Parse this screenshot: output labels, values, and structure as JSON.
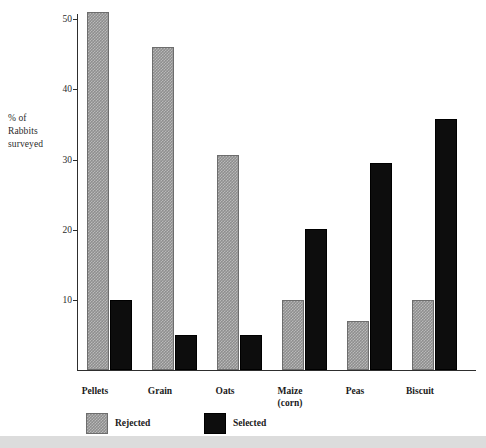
{
  "chart_data": {
    "type": "bar",
    "title": "",
    "subtitle": "",
    "xlabel": "",
    "ylabel": "% of Rabbits surveyed",
    "ylim": [
      0,
      52
    ],
    "yticks": [
      10,
      20,
      30,
      40,
      50
    ],
    "grid": false,
    "legend_position": "bottom-left",
    "categories": [
      "Pellets",
      "Grain",
      "Oats",
      "Maize (corn)",
      "Peas",
      "Biscuit"
    ],
    "series": [
      {
        "name": "Rejected",
        "color": "#8e8e8e",
        "values": [
          51,
          46,
          30.6,
          10,
          7,
          10
        ]
      },
      {
        "name": "Selected",
        "color": "#0d0d0d",
        "values": [
          10,
          5,
          5,
          20,
          29.5,
          35.7
        ]
      }
    ]
  },
  "axis": {
    "y_title_lines": [
      "% of",
      "Rabbits",
      "surveyed"
    ],
    "y_tick_labels": [
      "50",
      "40",
      "30",
      "20",
      "10"
    ]
  },
  "categories": [
    {
      "line1": "Pellets",
      "line2": ""
    },
    {
      "line1": "Grain",
      "line2": ""
    },
    {
      "line1": "Oats",
      "line2": ""
    },
    {
      "line1": "Maize",
      "line2": "(corn)"
    },
    {
      "line1": "Peas",
      "line2": ""
    },
    {
      "line1": "Biscuit",
      "line2": ""
    }
  ],
  "legend": {
    "items": [
      {
        "label": "Rejected"
      },
      {
        "label": "Selected"
      }
    ]
  }
}
